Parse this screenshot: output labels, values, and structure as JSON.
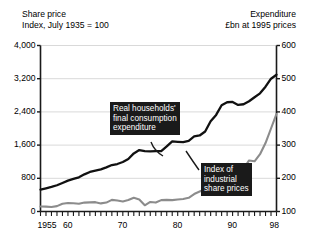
{
  "header": {
    "left_title": "Share price",
    "left_subtitle": "Index, July 1935 = 100",
    "right_title": "Expenditure",
    "right_subtitle": "£bn at 1995 prices"
  },
  "annotations": {
    "expenditure": {
      "line1": "Real households'",
      "line2": "final consumption",
      "line3": "expenditure"
    },
    "share_price": {
      "line1": "Index of",
      "line2": "industrial",
      "line3": "share prices"
    }
  },
  "chart_data": {
    "type": "line",
    "title": "",
    "subtitle": "",
    "xlabel": "",
    "ylabel": "Index, July 1935 = 100",
    "y2label": "£bn at 1995 prices",
    "grid": true,
    "legend": "annotations-on-plot",
    "xlim": [
      1955,
      1998
    ],
    "ylim": [
      0,
      4000
    ],
    "y2lim": [
      100,
      600
    ],
    "yticks": [
      0,
      800,
      1600,
      2400,
      3200,
      4000
    ],
    "ytick_labels": [
      "0",
      "800",
      "1,600",
      "2,400",
      "3,200",
      "4,000"
    ],
    "y2ticks": [
      100,
      200,
      300,
      400,
      500,
      600
    ],
    "y2tick_labels": [
      "100",
      "200",
      "300",
      "400",
      "500",
      "600"
    ],
    "xticks": [
      1955,
      1960,
      1970,
      1980,
      1990,
      1998
    ],
    "xtick_labels": [
      "1955",
      "60",
      "70",
      "80",
      "90",
      "98"
    ],
    "minor_xtick_interval": 1,
    "colors": {
      "expenditure": "#111111",
      "share_price": "#8c8c8c",
      "grid": "#d9d9d9",
      "axis": "#1a1a1a",
      "callout_bg": "#1a1a1a",
      "callout_text": "#ffffff"
    },
    "x": [
      1955,
      1956,
      1957,
      1958,
      1959,
      1960,
      1961,
      1962,
      1963,
      1964,
      1965,
      1966,
      1967,
      1968,
      1969,
      1970,
      1971,
      1972,
      1973,
      1974,
      1975,
      1976,
      1977,
      1978,
      1979,
      1980,
      1981,
      1982,
      1983,
      1984,
      1985,
      1986,
      1987,
      1988,
      1989,
      1990,
      1991,
      1992,
      1993,
      1994,
      1995,
      1996,
      1997,
      1998
    ],
    "series": [
      {
        "name": "Real households' final consumption expenditure",
        "axis": "right",
        "unit": "£bn at 1995 prices",
        "color": "#111111",
        "values": [
          166,
          170,
          174,
          179,
          186,
          193,
          198,
          203,
          212,
          219,
          223,
          227,
          233,
          240,
          243,
          249,
          258,
          275,
          285,
          282,
          281,
          282,
          282,
          296,
          311,
          310,
          309,
          313,
          326,
          329,
          341,
          372,
          391,
          420,
          429,
          430,
          421,
          423,
          432,
          444,
          456,
          476,
          500,
          512
        ]
      },
      {
        "name": "Index of industrial share prices",
        "axis": "left",
        "unit": "Index, July 1935 = 100",
        "color": "#8c8c8c",
        "values": [
          120,
          118,
          110,
          130,
          185,
          205,
          200,
          185,
          215,
          220,
          225,
          195,
          215,
          280,
          265,
          240,
          275,
          330,
          290,
          150,
          230,
          215,
          275,
          280,
          275,
          290,
          300,
          330,
          420,
          480,
          540,
          640,
          790,
          700,
          860,
          800,
          900,
          1030,
          1230,
          1210,
          1380,
          1650,
          2000,
          2350
        ]
      }
    ]
  }
}
